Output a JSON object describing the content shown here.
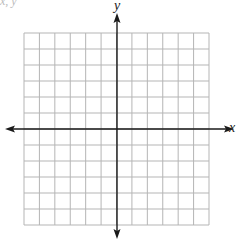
{
  "diagram": {
    "type": "coordinate-plane",
    "cropped_header_text": "x,  y  ",
    "x_axis_label": "x",
    "y_axis_label": "y",
    "grid": {
      "columns": 12,
      "rows": 12,
      "left": 24,
      "top": 33,
      "right": 209,
      "bottom": 225
    },
    "origin": {
      "x": 117,
      "y": 129
    },
    "colors": {
      "grid": "#b5b5b5",
      "axis": "#1a1a1a",
      "background": "#ffffff"
    }
  }
}
